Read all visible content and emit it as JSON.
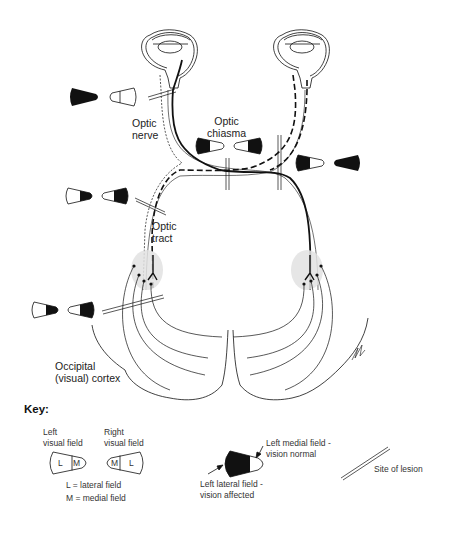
{
  "diagram": {
    "type": "visual pathway lesion diagram",
    "structures": {
      "optic_nerve": "Optic\nnerve",
      "optic_chiasma": "Optic\nchiasma",
      "optic_tract": "Optic\ntract",
      "occipital_cortex": "Occipital\n(visual) cortex"
    },
    "lesions": [
      {
        "site": "left optic nerve",
        "fields": [
          "left eye: complete loss",
          "right eye: normal"
        ]
      },
      {
        "site": "optic chiasma (central)",
        "fields": [
          "left: lateral lost",
          "right: lateral lost"
        ]
      },
      {
        "site": "right of chiasma",
        "fields": [
          "left: lateral lost",
          "right: complete loss"
        ]
      },
      {
        "site": "left optic tract",
        "fields": [
          "left: medial lost",
          "right: lateral lost"
        ]
      },
      {
        "site": "left optic radiation",
        "fields": [
          "left: medial lost",
          "right: lateral lost"
        ]
      }
    ]
  },
  "key": {
    "title": "Key:",
    "left_visual_field": "Left\nvisual field",
    "right_visual_field": "Right\nvisual field",
    "letter_l": "L",
    "letter_m": "M",
    "legend_l": "L = lateral field",
    "legend_m": "M = medial field",
    "medial_normal": "Left medial field -\nvision normal",
    "lateral_affected": "Left lateral field -\nvision affected",
    "site_of_lesion": "Site of lesion"
  },
  "colors": {
    "ink": "#111111",
    "nucleus_fill": "#dcdcdc",
    "background": "#ffffff"
  }
}
